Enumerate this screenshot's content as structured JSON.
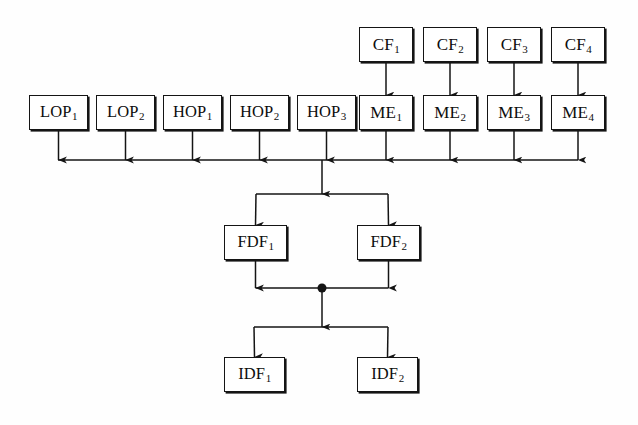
{
  "diagram": {
    "type": "block-flow-diagram",
    "title": "",
    "background_color": "#fefefe",
    "line_color": "#141414",
    "box_fill": "#ffffff",
    "rows": [
      {
        "row_name": "cf-row",
        "nodes": [
          {
            "id": "CF1",
            "base": "CF",
            "sub": "1",
            "x": 359,
            "y": 27,
            "w": 54,
            "h": 35
          },
          {
            "id": "CF2",
            "base": "CF",
            "sub": "2",
            "x": 423,
            "y": 27,
            "w": 54,
            "h": 35
          },
          {
            "id": "CF3",
            "base": "CF",
            "sub": "3",
            "x": 487,
            "y": 27,
            "w": 54,
            "h": 35
          },
          {
            "id": "CF4",
            "base": "CF",
            "sub": "4",
            "x": 551,
            "y": 27,
            "w": 54,
            "h": 35
          }
        ]
      },
      {
        "row_name": "operand-row",
        "nodes": [
          {
            "id": "LOP1",
            "base": "LOP",
            "sub": "1",
            "x": 29,
            "y": 95,
            "w": 59,
            "h": 35,
            "wide": true
          },
          {
            "id": "LOP2",
            "base": "LOP",
            "sub": "2",
            "x": 96,
            "y": 95,
            "w": 59,
            "h": 35,
            "wide": true
          },
          {
            "id": "HOP1",
            "base": "HOP",
            "sub": "1",
            "x": 163,
            "y": 95,
            "w": 59,
            "h": 35,
            "wide": true
          },
          {
            "id": "HOP2",
            "base": "HOP",
            "sub": "2",
            "x": 230,
            "y": 95,
            "w": 59,
            "h": 35,
            "wide": true
          },
          {
            "id": "HOP3",
            "base": "HOP",
            "sub": "3",
            "x": 297,
            "y": 95,
            "w": 59,
            "h": 35,
            "wide": true
          },
          {
            "id": "ME1",
            "base": "ME",
            "sub": "1",
            "x": 359,
            "y": 95,
            "w": 54,
            "h": 35
          },
          {
            "id": "ME2",
            "base": "ME",
            "sub": "2",
            "x": 423,
            "y": 95,
            "w": 54,
            "h": 35
          },
          {
            "id": "ME3",
            "base": "ME",
            "sub": "3",
            "x": 487,
            "y": 95,
            "w": 54,
            "h": 35
          },
          {
            "id": "ME4",
            "base": "ME",
            "sub": "4",
            "x": 551,
            "y": 95,
            "w": 54,
            "h": 35
          }
        ]
      },
      {
        "row_name": "fdf-row",
        "nodes": [
          {
            "id": "FDF1",
            "base": "FDF",
            "sub": "1",
            "x": 224,
            "y": 225,
            "w": 63,
            "h": 35,
            "wide": true
          },
          {
            "id": "FDF2",
            "base": "FDF",
            "sub": "2",
            "x": 357,
            "y": 225,
            "w": 63,
            "h": 35,
            "wide": true
          }
        ]
      },
      {
        "row_name": "idf-row",
        "nodes": [
          {
            "id": "IDF1",
            "base": "IDF",
            "sub": "1",
            "x": 224,
            "y": 357,
            "w": 61,
            "h": 35,
            "wide": true
          },
          {
            "id": "IDF2",
            "base": "IDF",
            "sub": "2",
            "x": 357,
            "y": 357,
            "w": 61,
            "h": 35,
            "wide": true
          }
        ]
      }
    ],
    "bus": {
      "name": "merge-bus",
      "y": 160,
      "x_start": 58,
      "x_end": 578,
      "feeding_nodes": [
        "LOP1",
        "LOP2",
        "HOP1",
        "HOP2",
        "HOP3",
        "ME1",
        "ME2",
        "ME3",
        "ME4"
      ],
      "output_x": 322
    },
    "junction_dot": {
      "name": "fdf-merge-dot",
      "x": 322,
      "y": 288,
      "r": 4.5
    },
    "split_bars": [
      {
        "name": "fdf-split-bar",
        "y": 194,
        "x_left": 256,
        "x_right": 388
      },
      {
        "name": "idf-split-bar",
        "y": 327,
        "x_left": 254,
        "x_right": 388
      }
    ]
  }
}
